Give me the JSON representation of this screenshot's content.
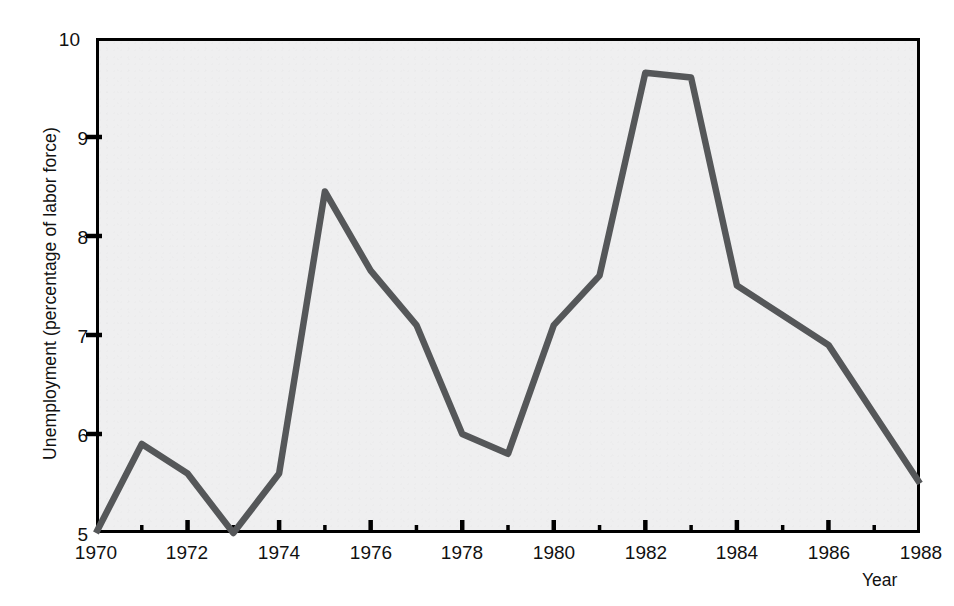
{
  "chart_data": {
    "type": "line",
    "title": "",
    "subtitle": "",
    "xlabel": "Year",
    "ylabel": "Unemployment (percentage of labor force)",
    "xlim": [
      1970,
      1988
    ],
    "ylim": [
      5,
      10
    ],
    "grid": false,
    "legend": null,
    "x": [
      1970,
      1971,
      1972,
      1973,
      1974,
      1975,
      1976,
      1977,
      1978,
      1979,
      1980,
      1981,
      1982,
      1983,
      1984,
      1985,
      1986,
      1987,
      1988
    ],
    "values": [
      5.0,
      5.9,
      5.6,
      5.0,
      5.6,
      8.45,
      7.65,
      7.1,
      6.0,
      5.8,
      7.1,
      7.6,
      9.65,
      9.6,
      7.5,
      7.2,
      6.9,
      6.2,
      5.5
    ],
    "series": [
      {
        "name": "Unemployment rate",
        "color": "#555759",
        "values": [
          5.0,
          5.9,
          5.6,
          5.0,
          5.6,
          8.45,
          7.65,
          7.1,
          6.0,
          5.8,
          7.1,
          7.6,
          9.65,
          9.6,
          7.5,
          7.2,
          6.9,
          6.2,
          5.5
        ]
      }
    ],
    "y_ticks": [
      5,
      6,
      7,
      8,
      9,
      10
    ],
    "y_tick_labels": [
      "5",
      "6",
      "7",
      "8",
      "9",
      "10"
    ],
    "x_major_ticks": [
      1970,
      1972,
      1974,
      1976,
      1978,
      1980,
      1982,
      1984,
      1986,
      1988
    ],
    "x_major_tick_labels": [
      "1970",
      "1972",
      "1974",
      "1976",
      "1978",
      "1980",
      "1982",
      "1984",
      "1986",
      "1988"
    ],
    "x_minor_ticks": [
      1971,
      1973,
      1975,
      1977,
      1979,
      1981,
      1983,
      1985,
      1987
    ],
    "colors": {
      "line": "#555759",
      "plot_background": "#efeff0",
      "axis": "#000000",
      "text": "#111111",
      "page_background": "#ffffff"
    }
  },
  "axis": {
    "y_label": "Unemployment (percentage of labor force)",
    "x_label": "Year",
    "y_tick_0": "5",
    "y_tick_1": "6",
    "y_tick_2": "7",
    "y_tick_3": "8",
    "y_tick_4": "9",
    "y_tick_5": "10",
    "x_tick_0": "1970",
    "x_tick_1": "1972",
    "x_tick_2": "1974",
    "x_tick_3": "1976",
    "x_tick_4": "1978",
    "x_tick_5": "1980",
    "x_tick_6": "1982",
    "x_tick_7": "1984",
    "x_tick_8": "1986",
    "x_tick_9": "1988"
  }
}
